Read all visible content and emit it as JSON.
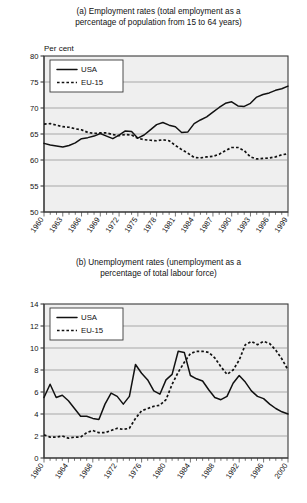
{
  "chart_data": [
    {
      "id": "employment",
      "type": "line",
      "title": "(a) Employment rates (total employment as a percentage of population from 15 to 64 years)",
      "title_line1": "(a) Employment rates (total employment as a",
      "title_line2": "percentage of population from 15 to 64 years)",
      "ylabel": "Per cent",
      "xlabel": "",
      "ylim": [
        50,
        80
      ],
      "yticks": [
        50,
        55,
        60,
        65,
        70,
        75,
        80
      ],
      "ytick_labels": [
        "50",
        "55",
        "60",
        "65",
        "70",
        "75",
        "80"
      ],
      "xlim": [
        1960,
        1999
      ],
      "xticks": [
        1960,
        1963,
        1966,
        1969,
        1972,
        1975,
        1978,
        1981,
        1984,
        1987,
        1990,
        1993,
        1996,
        1999
      ],
      "xtick_labels": [
        "1960",
        "1963",
        "1966",
        "1969",
        "1972",
        "1975",
        "1978",
        "1981",
        "1984",
        "1987",
        "1990",
        "1993",
        "1996",
        "1999"
      ],
      "grid": true,
      "legend_position": "upper-left",
      "x": [
        1960,
        1961,
        1962,
        1963,
        1964,
        1965,
        1966,
        1967,
        1968,
        1969,
        1970,
        1971,
        1972,
        1973,
        1974,
        1975,
        1976,
        1977,
        1978,
        1979,
        1980,
        1981,
        1982,
        1983,
        1984,
        1985,
        1986,
        1987,
        1988,
        1989,
        1990,
        1991,
        1992,
        1993,
        1994,
        1995,
        1996,
        1997,
        1998,
        1999
      ],
      "series": [
        {
          "name": "USA",
          "style": "solid",
          "color": "#111111",
          "values": [
            63.2,
            62.9,
            62.7,
            62.5,
            62.8,
            63.3,
            64.1,
            64.3,
            64.6,
            65.1,
            64.6,
            64.1,
            64.8,
            65.6,
            65.5,
            64.2,
            64.8,
            65.8,
            66.8,
            67.2,
            66.7,
            66.4,
            65.3,
            65.4,
            67.0,
            67.7,
            68.3,
            69.2,
            70.1,
            70.9,
            71.2,
            70.4,
            70.3,
            70.9,
            72.1,
            72.6,
            72.9,
            73.4,
            73.7,
            74.2
          ]
        },
        {
          "name": "EU-15",
          "style": "dashed",
          "color": "#111111",
          "values": [
            66.9,
            67.0,
            66.7,
            66.4,
            66.3,
            66.0,
            65.8,
            65.3,
            65.1,
            65.2,
            65.2,
            64.9,
            64.7,
            64.9,
            64.8,
            64.2,
            63.9,
            63.8,
            63.7,
            63.9,
            63.7,
            62.8,
            62.0,
            61.3,
            60.5,
            60.4,
            60.6,
            60.7,
            61.1,
            61.8,
            62.4,
            62.4,
            61.8,
            60.6,
            60.2,
            60.3,
            60.4,
            60.6,
            61.0,
            61.2
          ]
        }
      ]
    },
    {
      "id": "unemployment",
      "type": "line",
      "title": "(b) Unemployment rates (unemployment as a percentage of total labour force)",
      "title_line1": "(b) Unemployment rates (unemployment as a",
      "title_line2": "percentage of total labour force)",
      "ylabel": "Per cent",
      "xlabel": "",
      "ylim": [
        0,
        14
      ],
      "yticks": [
        0,
        2,
        4,
        6,
        8,
        10,
        12,
        14
      ],
      "ytick_labels": [
        "0",
        "2",
        "4",
        "6",
        "8",
        "10",
        "12",
        "14"
      ],
      "xlim": [
        1960,
        2000
      ],
      "xticks": [
        1960,
        1964,
        1968,
        1972,
        1976,
        1980,
        1984,
        1988,
        1992,
        1996,
        2000
      ],
      "xtick_labels": [
        "1960",
        "1964",
        "1968",
        "1972",
        "1976",
        "1980",
        "1984",
        "1988",
        "1992",
        "1996",
        "2000"
      ],
      "grid": true,
      "legend_position": "upper-left",
      "x": [
        1960,
        1961,
        1962,
        1963,
        1964,
        1965,
        1966,
        1967,
        1968,
        1969,
        1970,
        1971,
        1972,
        1973,
        1974,
        1975,
        1976,
        1977,
        1978,
        1979,
        1980,
        1981,
        1982,
        1983,
        1984,
        1985,
        1986,
        1987,
        1988,
        1989,
        1990,
        1991,
        1992,
        1993,
        1994,
        1995,
        1996,
        1997,
        1998,
        1999,
        2000
      ],
      "series": [
        {
          "name": "USA",
          "style": "solid",
          "color": "#111111",
          "values": [
            5.5,
            6.7,
            5.5,
            5.7,
            5.2,
            4.5,
            3.8,
            3.8,
            3.6,
            3.5,
            4.9,
            5.9,
            5.6,
            4.9,
            5.6,
            8.5,
            7.7,
            7.1,
            6.1,
            5.8,
            7.1,
            7.6,
            9.7,
            9.6,
            7.5,
            7.2,
            7.0,
            6.2,
            5.5,
            5.3,
            5.6,
            6.8,
            7.5,
            6.9,
            6.1,
            5.6,
            5.4,
            4.9,
            4.5,
            4.2,
            4.0
          ]
        },
        {
          "name": "EU-15",
          "style": "dashed",
          "color": "#111111",
          "values": [
            2.1,
            1.9,
            1.9,
            2.0,
            1.8,
            1.9,
            1.9,
            2.3,
            2.5,
            2.3,
            2.3,
            2.5,
            2.7,
            2.6,
            2.7,
            3.6,
            4.3,
            4.5,
            4.7,
            4.8,
            5.3,
            6.7,
            7.8,
            8.7,
            9.5,
            9.7,
            9.7,
            9.6,
            9.1,
            8.3,
            7.6,
            8.0,
            8.9,
            10.3,
            10.6,
            10.3,
            10.6,
            10.4,
            9.8,
            9.0,
            8.0
          ]
        }
      ]
    }
  ],
  "figure_a": {
    "title_line1": "(a) Employment rates (total employment as a",
    "title_line2": "percentage of population from 15 to 64 years)",
    "unit_label": "Per cent",
    "legend": {
      "usa": "USA",
      "eu": "EU-15"
    }
  },
  "figure_b": {
    "title_line1": "(b) Unemployment rates (unemployment as a",
    "title_line2": "percentage of total labour force)",
    "unit_label": "Per cent",
    "legend": {
      "usa": "USA",
      "eu": "EU-15"
    }
  }
}
